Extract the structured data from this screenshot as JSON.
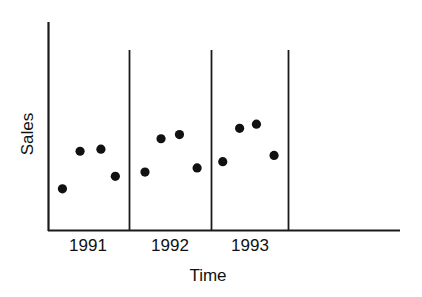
{
  "chart_data": {
    "type": "scatter",
    "title": "",
    "subtitle": "",
    "xlabel": "Time",
    "ylabel": "Sales",
    "grid": false,
    "legend": false,
    "legend_position": "none",
    "xlim": [
      0,
      4
    ],
    "ylim": [
      0,
      10
    ],
    "axis_tick_labels_y": [],
    "panel_separators": [
      1,
      2,
      3
    ],
    "categories": [
      "1991",
      "1992",
      "1993"
    ],
    "point_marker": "filled-circle",
    "point_color": "#111111",
    "axis_color": "#1a1a1a",
    "background_color": "#ffffff",
    "series": [
      {
        "name": "Sales",
        "points": [
          {
            "group": "1991",
            "index": 1,
            "x": 0.18,
            "y": 2.0
          },
          {
            "group": "1991",
            "index": 2,
            "x": 0.4,
            "y": 3.8
          },
          {
            "group": "1991",
            "index": 3,
            "x": 0.66,
            "y": 3.9
          },
          {
            "group": "1991",
            "index": 4,
            "x": 0.84,
            "y": 2.6
          },
          {
            "group": "1992",
            "index": 1,
            "x": 1.21,
            "y": 2.8
          },
          {
            "group": "1992",
            "index": 2,
            "x": 1.41,
            "y": 4.4
          },
          {
            "group": "1992",
            "index": 3,
            "x": 1.64,
            "y": 4.6
          },
          {
            "group": "1992",
            "index": 4,
            "x": 1.86,
            "y": 3.0
          },
          {
            "group": "1993",
            "index": 1,
            "x": 2.18,
            "y": 3.3
          },
          {
            "group": "1993",
            "index": 2,
            "x": 2.39,
            "y": 4.9
          },
          {
            "group": "1993",
            "index": 3,
            "x": 2.6,
            "y": 5.1
          },
          {
            "group": "1993",
            "index": 4,
            "x": 2.82,
            "y": 3.6
          }
        ]
      }
    ]
  },
  "axes": {
    "y_title": "Sales",
    "x_title": "Time"
  },
  "ticks": {
    "x": [
      {
        "label": "1991"
      },
      {
        "label": "1992"
      },
      {
        "label": "1993"
      }
    ]
  }
}
